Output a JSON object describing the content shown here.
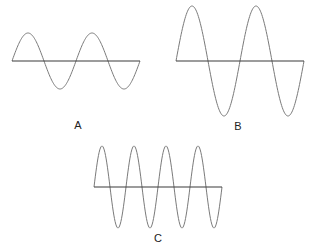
{
  "diagram": {
    "waves": [
      {
        "id": "A",
        "label": "A",
        "x0": 12,
        "x1": 140,
        "axis_y": 61,
        "amplitude": 28,
        "cycles": 2,
        "label_x": 78,
        "label_y": 129
      },
      {
        "id": "B",
        "label": "B",
        "x0": 176,
        "x1": 304,
        "axis_y": 61,
        "amplitude": 55,
        "cycles": 2,
        "label_x": 238,
        "label_y": 130
      },
      {
        "id": "C",
        "label": "C",
        "x0": 94,
        "x1": 222,
        "axis_y": 187,
        "amplitude": 41,
        "cycles": 4,
        "label_x": 158,
        "label_y": 242
      }
    ],
    "colors": {
      "wave": "#7a7a7a",
      "axis": "#3a3a3a",
      "label": "#222222"
    }
  }
}
